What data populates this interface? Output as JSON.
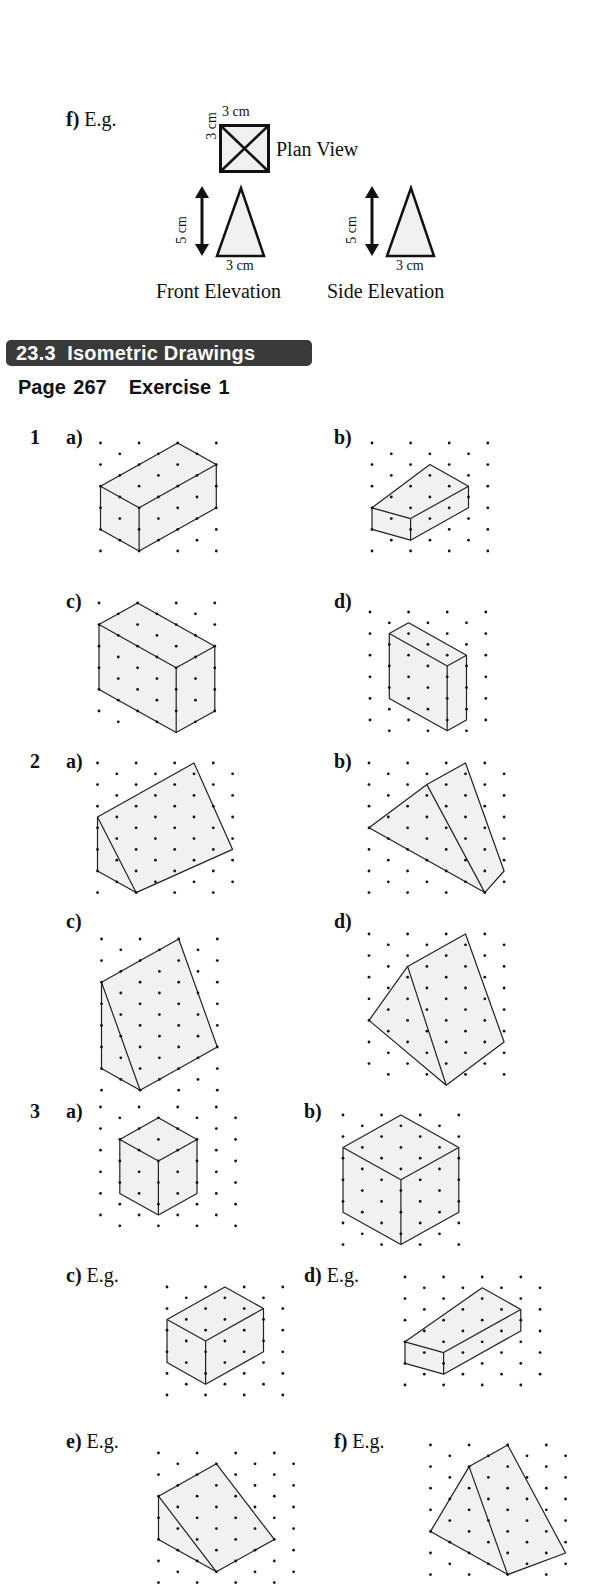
{
  "previous_question": {
    "part_label": "f)",
    "part_note": "E.g.",
    "plan_view": {
      "label": "Plan View",
      "width_label": "3 cm",
      "height_label": "3 cm"
    },
    "front_elevation": {
      "label": "Front Elevation",
      "height_label": "5 cm",
      "base_label": "3 cm"
    },
    "side_elevation": {
      "label": "Side Elevation",
      "height_label": "5 cm",
      "base_label": "3 cm"
    }
  },
  "section": {
    "number": "23.3",
    "title": "Isometric Drawings",
    "banner_color": "#3a3a3a"
  },
  "page_ref": {
    "page": "Page 267",
    "exercise": "Exercise 1"
  },
  "questions": [
    {
      "number": "1",
      "parts": [
        {
          "label": "a)",
          "note": "",
          "shape": "cuboid"
        },
        {
          "label": "b)",
          "note": "",
          "shape": "cuboid"
        },
        {
          "label": "c)",
          "note": "",
          "shape": "cuboid"
        },
        {
          "label": "d)",
          "note": "",
          "shape": "cuboid"
        }
      ]
    },
    {
      "number": "2",
      "parts": [
        {
          "label": "a)",
          "note": "",
          "shape": "triangular prism"
        },
        {
          "label": "b)",
          "note": "",
          "shape": "triangular prism"
        },
        {
          "label": "c)",
          "note": "",
          "shape": "triangular prism"
        },
        {
          "label": "d)",
          "note": "",
          "shape": "triangular prism"
        }
      ]
    },
    {
      "number": "3",
      "parts": [
        {
          "label": "a)",
          "note": "",
          "shape": "cube"
        },
        {
          "label": "b)",
          "note": "",
          "shape": "cube"
        },
        {
          "label": "c)",
          "note": "E.g.",
          "shape": "cuboid"
        },
        {
          "label": "d)",
          "note": "E.g.",
          "shape": "cuboid"
        },
        {
          "label": "e)",
          "note": "E.g.",
          "shape": "triangular prism"
        },
        {
          "label": "f)",
          "note": "E.g.",
          "shape": "triangular prism"
        }
      ]
    }
  ]
}
